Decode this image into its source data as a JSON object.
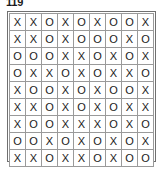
{
  "figure": {
    "label": "119"
  },
  "grid": {
    "rows": 9,
    "cols": 9,
    "symbols": [
      "X",
      "O"
    ],
    "border_color": "#707070",
    "cell_border_color": "#9a9a9a",
    "text_color": "#1a1a1a",
    "background_color": "#ffffff",
    "cells": [
      [
        "X",
        "X",
        "O",
        "X",
        "O",
        "X",
        "O",
        "O",
        "X"
      ],
      [
        "X",
        "X",
        "O",
        "X",
        "O",
        "O",
        "O",
        "X",
        "O"
      ],
      [
        "O",
        "O",
        "O",
        "X",
        "X",
        "O",
        "X",
        "O",
        "X"
      ],
      [
        "O",
        "X",
        "X",
        "O",
        "X",
        "O",
        "X",
        "X",
        "O"
      ],
      [
        "X",
        "O",
        "O",
        "X",
        "O",
        "X",
        "O",
        "O",
        "X"
      ],
      [
        "X",
        "X",
        "O",
        "X",
        "O",
        "X",
        "O",
        "X",
        "X"
      ],
      [
        "X",
        "O",
        "O",
        "X",
        "X",
        "X",
        "O",
        "X",
        "O"
      ],
      [
        "O",
        "O",
        "X",
        "O",
        "X",
        "O",
        "X",
        "O",
        "X"
      ],
      [
        "X",
        "X",
        "O",
        "X",
        "X",
        "O",
        "X",
        "O",
        "O"
      ]
    ]
  }
}
